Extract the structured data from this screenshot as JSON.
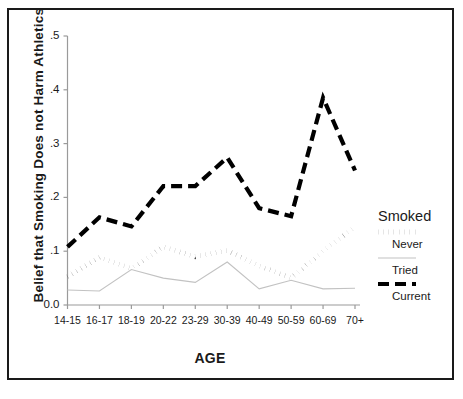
{
  "chart_data": {
    "type": "line",
    "title": "",
    "xlabel": "AGE",
    "ylabel": "Belief that Smoking Does not Harm Athletics",
    "categories": [
      "14-15",
      "16-17",
      "18-19",
      "20-22",
      "23-29",
      "30-39",
      "40-49",
      "50-59",
      "60-69",
      "70+"
    ],
    "ylim": [
      0.0,
      0.5
    ],
    "yticks": [
      "0.0",
      ".1",
      ".2",
      ".3",
      ".4",
      ".5"
    ],
    "ytick_values": [
      0.0,
      0.1,
      0.2,
      0.3,
      0.4,
      0.5
    ],
    "grid": false,
    "legend_position": "right",
    "legend_title": "Smoked",
    "series": [
      {
        "name": "Never",
        "style": "dotted",
        "color": "#000000",
        "values": [
          0.053,
          0.089,
          0.068,
          0.108,
          0.09,
          0.101,
          0.073,
          0.05,
          0.1,
          0.145
        ]
      },
      {
        "name": "Tried",
        "style": "solid-thin",
        "color": "#b8b8b8",
        "values": [
          0.028,
          0.026,
          0.066,
          0.05,
          0.042,
          0.08,
          0.03,
          0.046,
          0.03,
          0.031
        ]
      },
      {
        "name": "Current",
        "style": "dashed",
        "color": "#000000",
        "values": [
          0.108,
          0.163,
          0.146,
          0.221,
          0.221,
          0.274,
          0.18,
          0.165,
          0.385,
          0.25
        ]
      }
    ]
  },
  "legend": {
    "title": "Smoked",
    "entries": [
      {
        "label": "Never",
        "style": "dotted"
      },
      {
        "label": "Tried",
        "style": "solid-thin"
      },
      {
        "label": "Current",
        "style": "dashed"
      }
    ]
  }
}
